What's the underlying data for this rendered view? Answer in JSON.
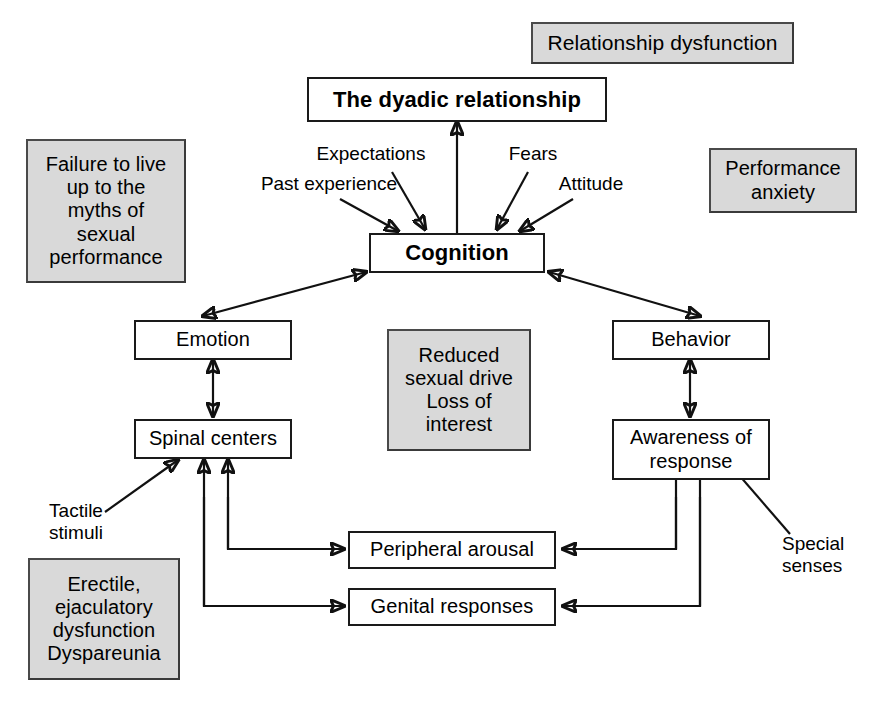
{
  "diagram": {
    "colors": {
      "line": "#111111",
      "box_border": "#1a1a1a",
      "gray_fill": "#d9d9d9",
      "gray_border": "#4a4a4a",
      "background": "#ffffff",
      "text": "#000000"
    },
    "nodes": [
      {
        "id": "dyadic",
        "label": "The dyadic relationship",
        "style": "white-bold"
      },
      {
        "id": "cognition",
        "label": "Cognition",
        "style": "white-bold"
      },
      {
        "id": "emotion",
        "label": "Emotion",
        "style": "white"
      },
      {
        "id": "behavior",
        "label": "Behavior",
        "style": "white"
      },
      {
        "id": "spinal",
        "label": "Spinal centers",
        "style": "white"
      },
      {
        "id": "awareness",
        "label": "Awareness of\nresponse",
        "style": "white"
      },
      {
        "id": "peripheral",
        "label": "Peripheral arousal",
        "style": "white"
      },
      {
        "id": "genital",
        "label": "Genital responses",
        "style": "white"
      }
    ],
    "gray_nodes": [
      {
        "id": "relationship-dysfunction",
        "label": "Relationship dysfunction"
      },
      {
        "id": "failure-myths",
        "label": "Failure to live\nup to the\nmyths of\nsexual\nperformance"
      },
      {
        "id": "performance-anxiety",
        "label": "Performance\nanxiety"
      },
      {
        "id": "reduced-drive",
        "label": "Reduced\nsexual drive\nLoss of\ninterest"
      },
      {
        "id": "erectile-dysfunction",
        "label": "Erectile,\nejaculatory\ndysfunction\nDyspareunia"
      }
    ],
    "labels": [
      {
        "id": "expectations",
        "label": "Expectations"
      },
      {
        "id": "fears",
        "label": "Fears"
      },
      {
        "id": "past-experience",
        "label": "Past experience"
      },
      {
        "id": "attitude",
        "label": "Attitude"
      },
      {
        "id": "tactile-stimuli",
        "label": "Tactile\nstimuli"
      },
      {
        "id": "special-senses",
        "label": "Special\nsenses"
      }
    ],
    "connections": [
      {
        "from": "cognition",
        "to": "dyadic",
        "direction": "one-way"
      },
      {
        "from": "expectations",
        "to": "cognition",
        "direction": "one-way"
      },
      {
        "from": "fears",
        "to": "cognition",
        "direction": "one-way"
      },
      {
        "from": "past-experience",
        "to": "cognition",
        "direction": "one-way"
      },
      {
        "from": "attitude",
        "to": "cognition",
        "direction": "one-way"
      },
      {
        "from": "cognition",
        "to": "emotion",
        "direction": "two-way"
      },
      {
        "from": "cognition",
        "to": "behavior",
        "direction": "two-way"
      },
      {
        "from": "emotion",
        "to": "spinal",
        "direction": "two-way"
      },
      {
        "from": "behavior",
        "to": "awareness",
        "direction": "two-way"
      },
      {
        "from": "tactile-stimuli",
        "to": "spinal",
        "direction": "one-way"
      },
      {
        "from": "spinal",
        "to": "peripheral",
        "direction": "one-way"
      },
      {
        "from": "spinal",
        "to": "genital",
        "direction": "one-way"
      },
      {
        "from": "peripheral",
        "to": "spinal",
        "direction": "one-way"
      },
      {
        "from": "genital",
        "to": "spinal",
        "direction": "one-way"
      },
      {
        "from": "peripheral",
        "to": "awareness",
        "direction": "one-way"
      },
      {
        "from": "genital",
        "to": "awareness",
        "direction": "one-way"
      },
      {
        "from": "awareness",
        "to": "peripheral",
        "direction": "one-way"
      },
      {
        "from": "awareness",
        "to": "genital",
        "direction": "one-way"
      },
      {
        "from": "special-senses",
        "to": "awareness",
        "direction": "one-way"
      }
    ]
  }
}
